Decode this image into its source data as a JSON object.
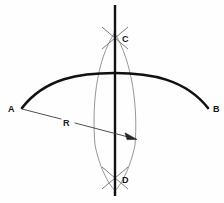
{
  "figure": {
    "canvas": {
      "width": 224,
      "height": 203,
      "background": "#fefefe"
    },
    "labels": {
      "point_a": "A",
      "point_b": "B",
      "point_c": "C",
      "point_d": "D",
      "radius": "R"
    },
    "colors": {
      "main_arc": "#111111",
      "vertical_line": "#111111",
      "construction_arc": "#8a8a8a",
      "radius_line": "#3a3a3a",
      "label_text": "#141414",
      "background": "#fefefe"
    },
    "geometry": {
      "point_a": {
        "x": 22,
        "y": 108
      },
      "point_b": {
        "x": 208,
        "y": 108
      },
      "point_c": {
        "x": 115,
        "y": 38
      },
      "point_d": {
        "x": 115,
        "y": 178
      },
      "arc_apex": {
        "x": 115,
        "y": 73
      },
      "vertical_line": {
        "x": 115,
        "y_top": 5,
        "y_bottom": 196
      },
      "lens_left_bulge_x": 92,
      "lens_right_bulge_x": 138,
      "radius_arrow_tip": {
        "x": 137,
        "y": 139
      },
      "radius_label_pos": {
        "x": 63,
        "y": 126
      }
    },
    "elements": [
      "main-arc-ab",
      "vertical-line-cd",
      "construction-arc-left",
      "construction-arc-right",
      "cross-mark-c",
      "cross-mark-d",
      "radius-arrow-r"
    ]
  }
}
